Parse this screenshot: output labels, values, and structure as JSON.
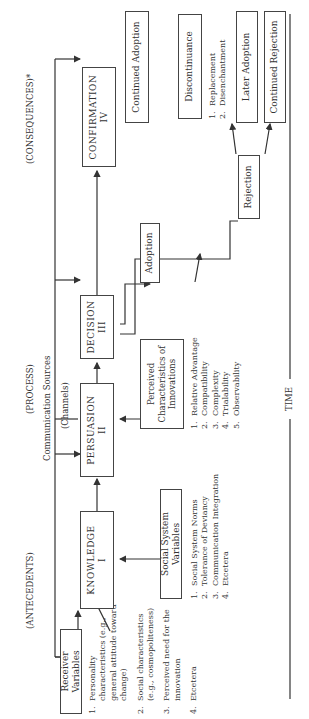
{
  "headers": {
    "antecedents": "(ANTECEDENTS)",
    "process": "(PROCESS)",
    "consequences": "(CONSEQUENCES)*"
  },
  "communication": {
    "line1": "Communication Sources",
    "line2": "(Channels)"
  },
  "receiver_variables": {
    "title": "Receiver Variables",
    "items": [
      {
        "n": "1.",
        "text": "Personality characteristics (e.g., general attitude toward change)"
      },
      {
        "n": "2.",
        "text": "Social characteristics (e.g., cosmopoliteness)"
      },
      {
        "n": "3.",
        "text": "Perceived need for the innovation"
      },
      {
        "n": "4.",
        "text": "Etcetera"
      }
    ]
  },
  "social_system_variables": {
    "title": "Social System Variables",
    "items": [
      {
        "n": "1.",
        "text": "Social System Norms"
      },
      {
        "n": "2.",
        "text": "Tolerance of Deviancy"
      },
      {
        "n": "3.",
        "text": "Communication Integration"
      },
      {
        "n": "4.",
        "text": "Etcetera"
      }
    ]
  },
  "perceived_characteristics": {
    "title_line1": "Perceived",
    "title_line2": "Characteristics of",
    "title_line3": "Innovations",
    "items": [
      {
        "n": "1.",
        "text": "Relative Advantage"
      },
      {
        "n": "2.",
        "text": "Compatibility"
      },
      {
        "n": "3.",
        "text": "Complexity"
      },
      {
        "n": "4.",
        "text": "Trialability"
      },
      {
        "n": "5.",
        "text": "Observability"
      }
    ]
  },
  "stages": {
    "knowledge": {
      "name": "KNOWLEDGE",
      "num": "I"
    },
    "persuasion": {
      "name": "PERSUASION",
      "num": "II"
    },
    "decision": {
      "name": "DECISION",
      "num": "III"
    },
    "confirmation": {
      "name": "CONFIRMATION",
      "num": "IV"
    }
  },
  "outcomes": {
    "adoption": "Adoption",
    "rejection": "Rejection",
    "continued_adoption": "Continued Adoption",
    "discontinuance": "Discontinuance",
    "later_adoption": "Later Adoption",
    "continued_rejection": "Continued Rejection"
  },
  "discontinuance_types": [
    {
      "n": "1.",
      "text": "Replacement"
    },
    {
      "n": "2.",
      "text": "Disenchantment"
    }
  ],
  "time_label": "TIME"
}
